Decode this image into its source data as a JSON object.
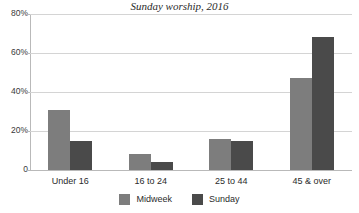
{
  "chart_data": {
    "type": "bar",
    "title": "Sunday worship, 2016",
    "xlabel": "",
    "ylabel": "",
    "categories": [
      "Under 16",
      "16 to 24",
      "25 to 44",
      "45 & over"
    ],
    "series": [
      {
        "name": "Midweek",
        "color": "#7d7d7d",
        "values": [
          31,
          8,
          16,
          47
        ]
      },
      {
        "name": "Sunday",
        "color": "#4a4a4a",
        "values": [
          15,
          4,
          15,
          68
        ]
      }
    ],
    "ylim": [
      0,
      80
    ],
    "yticks": [
      0,
      20,
      40,
      60,
      80
    ],
    "ytick_labels": [
      "0",
      "20%",
      "40%",
      "60%",
      "80%"
    ],
    "grid": true,
    "legend_position": "bottom"
  }
}
